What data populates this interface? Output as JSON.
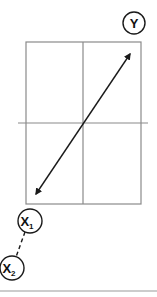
{
  "diagram": {
    "labels": {
      "y": "Y",
      "x1_main": "X",
      "x1_sub": "1",
      "x2_main": "X",
      "x2_sub": "2"
    },
    "colors": {
      "box_line": "#8a8a8a",
      "arrow": "#1a1a1a",
      "circle": "#1a1a1a",
      "baseline": "#9a9a9a",
      "background": "#ffffff"
    }
  }
}
